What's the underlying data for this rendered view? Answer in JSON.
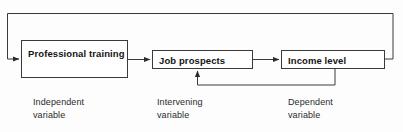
{
  "diagram": {
    "type": "flow-diagram",
    "background_color": "#fdfdfd",
    "line_color": "#3a3a3a",
    "text_color": "#141414",
    "nodes": [
      {
        "id": "professional-training",
        "label": "Professional\ntraining",
        "role": "independent",
        "caption": "Independent\nvariable"
      },
      {
        "id": "job-prospects",
        "label": "Job prospects",
        "role": "intervening",
        "caption": "Intervening\nvariable"
      },
      {
        "id": "income-level",
        "label": "Income level",
        "role": "dependent",
        "caption": "Dependent\nvariable"
      }
    ],
    "connectors": [
      {
        "id": "training-to-prospects",
        "from": "professional-training",
        "to": "job-prospects",
        "style": "straight-arrow",
        "direction": "right"
      },
      {
        "id": "prospects-to-income",
        "from": "job-prospects",
        "to": "income-level",
        "style": "straight-arrow",
        "direction": "right"
      },
      {
        "id": "income-feedback-to-prospects",
        "from": "income-level",
        "to": "job-prospects",
        "style": "elbow-arrow",
        "direction": "up"
      },
      {
        "id": "income-feedback-to-training",
        "from": "income-level",
        "to": "professional-training",
        "style": "elbow-arrow",
        "direction": "right"
      }
    ]
  }
}
